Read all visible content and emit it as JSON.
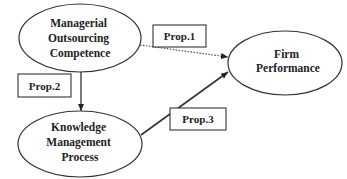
{
  "diagram": {
    "colors": {
      "background": "#ffffff",
      "stroke": "#333333",
      "text": "#222222"
    },
    "nodes": [
      {
        "id": "managerial-outsourcing-competence",
        "lines": [
          "Managerial",
          "Outsourcing",
          "Competence"
        ],
        "shape": "ellipse"
      },
      {
        "id": "firm-performance",
        "lines": [
          "Firm",
          "Performance"
        ],
        "shape": "ellipse"
      },
      {
        "id": "knowledge-management-process",
        "lines": [
          "Knowledge",
          "Management",
          "Process"
        ],
        "shape": "ellipse"
      }
    ],
    "propositions": [
      {
        "label": "Prop.1",
        "from": "managerial-outsourcing-competence",
        "to": "firm-performance",
        "style": "dotted"
      },
      {
        "label": "Prop.2",
        "from": "managerial-outsourcing-competence",
        "to": "knowledge-management-process",
        "style": "solid"
      },
      {
        "label": "Prop.3",
        "from": "knowledge-management-process",
        "to": "firm-performance",
        "style": "solid"
      }
    ]
  }
}
